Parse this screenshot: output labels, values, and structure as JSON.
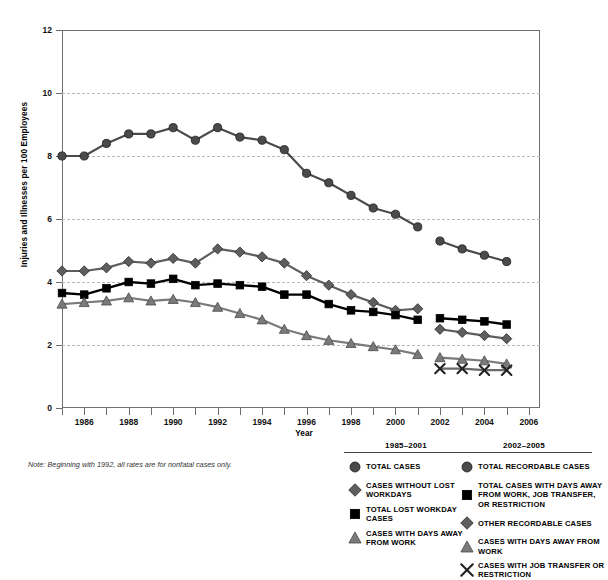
{
  "top_sliver": "",
  "axes": {
    "ylabel": "Injuries and Illnesses per 100 Employees",
    "xlabel": "Year",
    "yticks": [
      "0",
      "2",
      "4",
      "6",
      "8",
      "10",
      "12"
    ],
    "xticks": [
      "1986",
      "1988",
      "1990",
      "1992",
      "1994",
      "1996",
      "1998",
      "2000",
      "2002",
      "2004",
      "2006"
    ]
  },
  "note": "Note: Beginning with 1992, all rates are for nonfatal cases only.",
  "legend_left": {
    "title": "1985–2001",
    "items": [
      {
        "marker": "circle-marker",
        "label": "TOTAL CASES",
        "color": "#4a4a4a"
      },
      {
        "marker": "diamond-marker",
        "label": "CASES WITHOUT LOST WORKDAYS",
        "color": "#5e5e5e"
      },
      {
        "marker": "square-marker",
        "label": "TOTAL LOST WORKDAY CASES",
        "color": "#000000"
      },
      {
        "marker": "triangle-marker",
        "label": "CASES WITH DAYS AWAY FROM WORK",
        "color": "#7a7a7a"
      }
    ]
  },
  "legend_right": {
    "title": "2002–2005",
    "items": [
      {
        "marker": "circle-marker",
        "label": "TOTAL RECORDABLE CASES",
        "color": "#4a4a4a"
      },
      {
        "marker": "square-marker",
        "label": "TOTAL CASES WITH DAYS AWAY FROM WORK, JOB TRANSFER, OR RESTRICTION",
        "color": "#000000"
      },
      {
        "marker": "diamond-marker",
        "label": "OTHER RECORDABLE CASES",
        "color": "#5e5e5e"
      },
      {
        "marker": "triangle-marker",
        "label": "CASES WITH DAYS AWAY FROM WORK",
        "color": "#7a7a7a"
      },
      {
        "marker": "x-marker",
        "label": "CASES WITH JOB TRANSFER OR RESTRICTION",
        "color": "#6a6a6a"
      }
    ]
  },
  "chart_data": {
    "type": "line",
    "title": "",
    "xlabel": "Year",
    "ylabel": "Injuries and Illnesses per 100 Employees",
    "xlim": [
      1985,
      2006.5
    ],
    "ylim": [
      0,
      12
    ],
    "grid": true,
    "legend_position": "below",
    "series": [
      {
        "name": "TOTAL CASES",
        "period": "1985-2001",
        "marker": "circle-marker",
        "color": "#4a4a4a",
        "x": [
          1985,
          1986,
          1987,
          1988,
          1989,
          1990,
          1991,
          1992,
          1993,
          1994,
          1995,
          1996,
          1997,
          1998,
          1999,
          2000,
          2001
        ],
        "values": [
          8.0,
          8.0,
          8.4,
          8.7,
          8.7,
          8.9,
          8.5,
          8.9,
          8.6,
          8.5,
          8.2,
          7.45,
          7.15,
          6.75,
          6.35,
          6.15,
          5.75
        ]
      },
      {
        "name": "CASES WITHOUT LOST WORKDAYS",
        "period": "1985-2001",
        "marker": "diamond-marker",
        "color": "#5e5e5e",
        "x": [
          1985,
          1986,
          1987,
          1988,
          1989,
          1990,
          1991,
          1992,
          1993,
          1994,
          1995,
          1996,
          1997,
          1998,
          1999,
          2000,
          2001
        ],
        "values": [
          4.35,
          4.35,
          4.45,
          4.65,
          4.6,
          4.75,
          4.6,
          5.05,
          4.95,
          4.8,
          4.6,
          4.2,
          3.9,
          3.6,
          3.35,
          3.1,
          3.15
        ]
      },
      {
        "name": "TOTAL LOST WORKDAY CASES",
        "period": "1985-2001",
        "marker": "square-marker",
        "color": "#000000",
        "x": [
          1985,
          1986,
          1987,
          1988,
          1989,
          1990,
          1991,
          1992,
          1993,
          1994,
          1995,
          1996,
          1997,
          1998,
          1999,
          2000,
          2001
        ],
        "values": [
          3.65,
          3.6,
          3.8,
          4.0,
          3.95,
          4.1,
          3.9,
          3.95,
          3.9,
          3.85,
          3.6,
          3.6,
          3.3,
          3.1,
          3.05,
          2.95,
          2.8
        ]
      },
      {
        "name": "CASES WITH DAYS AWAY FROM WORK",
        "period": "1985-2001",
        "marker": "triangle-marker",
        "color": "#7a7a7a",
        "x": [
          1985,
          1986,
          1987,
          1988,
          1989,
          1990,
          1991,
          1992,
          1993,
          1994,
          1995,
          1996,
          1997,
          1998,
          1999,
          2000,
          2001
        ],
        "values": [
          3.3,
          3.35,
          3.4,
          3.5,
          3.4,
          3.45,
          3.35,
          3.2,
          3.0,
          2.8,
          2.5,
          2.3,
          2.15,
          2.05,
          1.95,
          1.85,
          1.7
        ]
      },
      {
        "name": "TOTAL RECORDABLE CASES",
        "period": "2002-2005",
        "marker": "circle-marker",
        "color": "#4a4a4a",
        "x": [
          2002,
          2003,
          2004,
          2005
        ],
        "values": [
          5.3,
          5.05,
          4.85,
          4.65
        ]
      },
      {
        "name": "TOTAL CASES WITH DAYS AWAY FROM WORK, JOB TRANSFER, OR RESTRICTION",
        "period": "2002-2005",
        "marker": "square-marker",
        "color": "#000000",
        "x": [
          2002,
          2003,
          2004,
          2005
        ],
        "values": [
          2.85,
          2.8,
          2.75,
          2.65
        ]
      },
      {
        "name": "OTHER RECORDABLE CASES",
        "period": "2002-2005",
        "marker": "diamond-marker",
        "color": "#5e5e5e",
        "x": [
          2002,
          2003,
          2004,
          2005
        ],
        "values": [
          2.5,
          2.4,
          2.3,
          2.2
        ]
      },
      {
        "name": "CASES WITH DAYS AWAY FROM WORK",
        "period": "2002-2005",
        "marker": "triangle-marker",
        "color": "#7a7a7a",
        "x": [
          2002,
          2003,
          2004,
          2005
        ],
        "values": [
          1.6,
          1.55,
          1.5,
          1.4
        ]
      },
      {
        "name": "CASES WITH JOB TRANSFER OR RESTRICTION",
        "period": "2002-2005",
        "marker": "x-marker",
        "color": "#6a6a6a",
        "x": [
          2002,
          2003,
          2004,
          2005
        ],
        "values": [
          1.25,
          1.25,
          1.2,
          1.2
        ]
      }
    ]
  }
}
